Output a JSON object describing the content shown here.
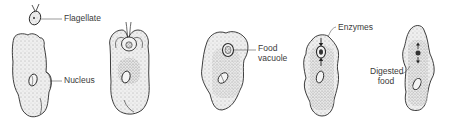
{
  "diagram": {
    "type": "biology-process",
    "stages": [
      {
        "id": 1,
        "description": "Amoeba approaching flagellate",
        "labels": [
          "Flagellate",
          "Nucleus"
        ]
      },
      {
        "id": 2,
        "description": "Amoeba engulfing flagellate with pseudopods",
        "labels": []
      },
      {
        "id": 3,
        "description": "Flagellate enclosed in food vacuole",
        "labels": [
          "Food vacuole"
        ]
      },
      {
        "id": 4,
        "description": "Enzymes entering food vacuole",
        "labels": [
          "Enzymes"
        ]
      },
      {
        "id": 5,
        "description": "Digested food diffusing into cytoplasm",
        "labels": [
          "Digested food"
        ]
      }
    ],
    "labels": {
      "flagellate": "Flagellate",
      "nucleus": "Nucleus",
      "food_vacuole_line1": "Food",
      "food_vacuole_line2": "vacuole",
      "enzymes": "Enzymes",
      "digested_food_line1": "Digested",
      "digested_food_line2": "food"
    },
    "colors": {
      "outline": "#2a2a2a",
      "cytoplasm": "#eeeeee",
      "stipple": "#555555",
      "label_text": "#3a3a3a"
    }
  }
}
